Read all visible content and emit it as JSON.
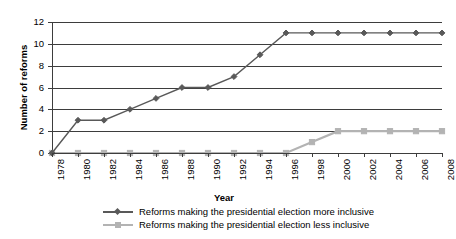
{
  "chart_data": {
    "type": "line",
    "title": "",
    "xlabel": "Year",
    "ylabel": "Number of reforms",
    "ylim": [
      0,
      12
    ],
    "ytick_step": 2,
    "yticks": [
      0,
      2,
      4,
      6,
      8,
      10,
      12
    ],
    "grid": true,
    "legend_position": "bottom",
    "categories": [
      1978,
      1980,
      1982,
      1984,
      1986,
      1988,
      1990,
      1992,
      1994,
      1996,
      1998,
      2000,
      2002,
      2004,
      2006,
      2008
    ],
    "xtick_labels": [
      "1978",
      "1980",
      "1982",
      "1984",
      "1986",
      "1988",
      "1990",
      "1992",
      "1994",
      "1996",
      "1998",
      "2000",
      "2002",
      "2004",
      "2006",
      "2008"
    ],
    "series": [
      {
        "name": "Reforms making the presidential election more inclusive",
        "color": "#595959",
        "marker": "diamond",
        "values": [
          0,
          3,
          3,
          4,
          5,
          6,
          6,
          7,
          9,
          11,
          11,
          11,
          11,
          11,
          11,
          11
        ]
      },
      {
        "name": "Reforms making the presidential election less inclusive",
        "color": "#b3b3b3",
        "marker": "square",
        "values": [
          0,
          0,
          0,
          0,
          0,
          0,
          0,
          0,
          0,
          0,
          1,
          2,
          2,
          2,
          2,
          2
        ]
      }
    ]
  },
  "legend": {
    "items": [
      {
        "label": "Reforms making the presidential election more inclusive"
      },
      {
        "label": "Reforms making the presidential election less inclusive"
      }
    ]
  }
}
